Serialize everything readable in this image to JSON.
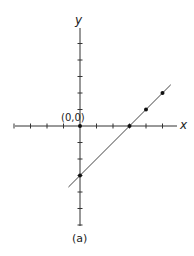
{
  "chart_data": {
    "type": "line",
    "title": "",
    "caption": "(a)",
    "xlabel": "x",
    "ylabel": "y",
    "origin_label": "(0,0)",
    "xlim": [
      -4,
      6
    ],
    "ylim": [
      -6,
      6
    ],
    "grid": false,
    "ticks": {
      "x": [
        -4,
        -3,
        -2,
        -1,
        1,
        2,
        3,
        4,
        5
      ],
      "y": [
        -6,
        -5,
        -4,
        -3,
        -2,
        -1,
        1,
        2,
        3,
        4,
        5
      ]
    },
    "series": [
      {
        "name": "line",
        "equation": "y = x - 3",
        "x": [
          -0.7,
          5.5
        ],
        "y": [
          -3.7,
          2.5
        ]
      }
    ],
    "points": [
      {
        "x": 0,
        "y": 0
      },
      {
        "x": 3,
        "y": 0
      },
      {
        "x": 4,
        "y": 1
      },
      {
        "x": 5,
        "y": 2
      },
      {
        "x": 0,
        "y": -3
      }
    ],
    "colors": {
      "axis": "#333333",
      "line": "#444444",
      "point": "#111111"
    }
  }
}
